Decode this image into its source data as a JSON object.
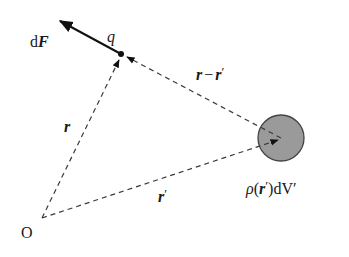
{
  "diagram": {
    "type": "vector-geometry",
    "colors": {
      "line": "#3a3a3a",
      "arrow": "#111111",
      "sphere_fill": "#9a9a9a",
      "sphere_stroke": "#444444",
      "background": "#ffffff"
    },
    "points": {
      "origin": {
        "label": "O",
        "x": 42,
        "y": 218
      },
      "charge": {
        "label": "q",
        "x": 121,
        "y": 54
      },
      "source": {
        "x": 281,
        "y": 138,
        "radius": 23
      }
    },
    "labels": {
      "force": {
        "prefix": "d",
        "symbol": "F"
      },
      "charge": "q",
      "origin": "O",
      "r": "r",
      "r_prime": "r",
      "prime": "′",
      "r_minus_r_prime": {
        "a": "r",
        "minus": "−",
        "b": "r"
      },
      "density": {
        "rho": "ρ",
        "open": "(",
        "r": "r",
        "close": ")",
        "dv": "dV′"
      }
    }
  }
}
